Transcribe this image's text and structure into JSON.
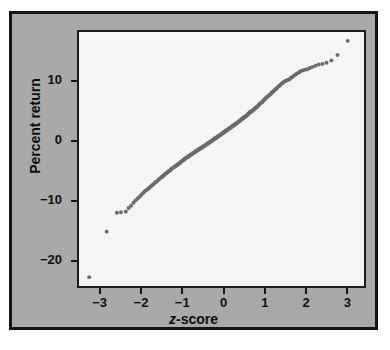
{
  "figure": {
    "panel_bg": "#a9a9a9",
    "plot_bg": "#f5f5f5",
    "frame_color": "#141414",
    "point_color": "#6b6b6b"
  },
  "axes": {
    "x_label_prefix": "z",
    "x_label_suffix": "-score",
    "y_label": "Percent return",
    "x_ticks": [
      "−3",
      "−2",
      "−1",
      "0",
      "1",
      "2",
      "3"
    ],
    "y_ticks": [
      "10",
      "0",
      "−10",
      "−20"
    ]
  },
  "chart_data": {
    "type": "scatter",
    "title": "",
    "subtitle": "",
    "xlabel": "z-score",
    "ylabel": "Percent return",
    "xlim": [
      -3.55,
      3.45
    ],
    "ylim": [
      -24.5,
      18.5
    ],
    "xticks": [
      -3,
      -2,
      -1,
      0,
      1,
      2,
      3
    ],
    "yticks": [
      10,
      0,
      -10,
      -20
    ],
    "grid": false,
    "legend": null,
    "annotations": [],
    "series": [
      {
        "name": "Percent return vs z-score",
        "marker": "circle",
        "color": "#6b6b6b",
        "x": [
          -3.3,
          -2.87,
          -2.62,
          -2.52,
          -2.4,
          -2.33,
          -2.27,
          -2.21,
          -2.16,
          -2.11,
          -2.06,
          -2.02,
          -1.98,
          -1.94,
          -1.9,
          -1.86,
          -1.83,
          -1.79,
          -1.76,
          -1.73,
          -1.7,
          -1.67,
          -1.64,
          -1.61,
          -1.58,
          -1.56,
          -1.53,
          -1.5,
          -1.48,
          -1.45,
          -1.43,
          -1.4,
          -1.38,
          -1.36,
          -1.33,
          -1.31,
          -1.29,
          -1.27,
          -1.25,
          -1.22,
          -1.2,
          -1.18,
          -1.16,
          -1.14,
          -1.12,
          -1.1,
          -1.08,
          -1.06,
          -1.05,
          -1.03,
          -1.01,
          -0.99,
          -0.97,
          -0.95,
          -0.94,
          -0.92,
          -0.9,
          -0.88,
          -0.87,
          -0.85,
          -0.83,
          -0.82,
          -0.8,
          -0.78,
          -0.77,
          -0.75,
          -0.74,
          -0.72,
          -0.7,
          -0.69,
          -0.67,
          -0.66,
          -0.64,
          -0.63,
          -0.61,
          -0.6,
          -0.58,
          -0.57,
          -0.55,
          -0.54,
          -0.52,
          -0.51,
          -0.49,
          -0.48,
          -0.46,
          -0.45,
          -0.43,
          -0.42,
          -0.41,
          -0.39,
          -0.38,
          -0.36,
          -0.35,
          -0.33,
          -0.32,
          -0.31,
          -0.29,
          -0.28,
          -0.26,
          -0.25,
          -0.24,
          -0.22,
          -0.21,
          -0.19,
          -0.18,
          -0.17,
          -0.15,
          -0.14,
          -0.13,
          -0.11,
          -0.1,
          -0.08,
          -0.07,
          -0.06,
          -0.04,
          -0.03,
          -0.02,
          0.0,
          0.01,
          0.02,
          0.04,
          0.05,
          0.06,
          0.08,
          0.09,
          0.11,
          0.12,
          0.13,
          0.15,
          0.16,
          0.17,
          0.19,
          0.2,
          0.22,
          0.23,
          0.24,
          0.26,
          0.27,
          0.28,
          0.3,
          0.31,
          0.33,
          0.34,
          0.35,
          0.37,
          0.38,
          0.4,
          0.41,
          0.42,
          0.44,
          0.45,
          0.47,
          0.48,
          0.5,
          0.51,
          0.53,
          0.54,
          0.56,
          0.57,
          0.59,
          0.6,
          0.62,
          0.63,
          0.65,
          0.66,
          0.68,
          0.7,
          0.71,
          0.73,
          0.75,
          0.76,
          0.78,
          0.8,
          0.81,
          0.83,
          0.85,
          0.87,
          0.88,
          0.9,
          0.92,
          0.94,
          0.96,
          0.98,
          0.99,
          1.01,
          1.03,
          1.05,
          1.07,
          1.09,
          1.12,
          1.14,
          1.16,
          1.18,
          1.2,
          1.23,
          1.25,
          1.27,
          1.3,
          1.32,
          1.35,
          1.38,
          1.4,
          1.43,
          1.46,
          1.49,
          1.52,
          1.55,
          1.58,
          1.62,
          1.65,
          1.69,
          1.73,
          1.77,
          1.81,
          1.86,
          1.9,
          1.95,
          2.0,
          2.06,
          2.12,
          2.19,
          2.26,
          2.34,
          2.43,
          2.53,
          2.65,
          2.8,
          3.05
        ],
        "y": [
          -23.0,
          -15.3,
          -12.1,
          -12.0,
          -11.9,
          -11.3,
          -10.9,
          -10.4,
          -10.0,
          -9.7,
          -9.4,
          -9.1,
          -8.8,
          -8.5,
          -8.3,
          -8.1,
          -7.9,
          -7.7,
          -7.5,
          -7.3,
          -7.1,
          -6.9,
          -6.8,
          -6.6,
          -6.4,
          -6.3,
          -6.1,
          -6.0,
          -5.8,
          -5.7,
          -5.5,
          -5.4,
          -5.3,
          -5.1,
          -5.0,
          -4.9,
          -4.8,
          -4.6,
          -4.5,
          -4.4,
          -4.3,
          -4.2,
          -4.1,
          -4.0,
          -3.9,
          -3.8,
          -3.7,
          -3.6,
          -3.5,
          -3.4,
          -3.3,
          -3.2,
          -3.1,
          -3.0,
          -2.9,
          -2.8,
          -2.7,
          -2.7,
          -2.6,
          -2.5,
          -2.4,
          -2.3,
          -2.3,
          -2.2,
          -2.1,
          -2.0,
          -2.0,
          -1.9,
          -1.8,
          -1.7,
          -1.7,
          -1.6,
          -1.5,
          -1.5,
          -1.4,
          -1.3,
          -1.3,
          -1.2,
          -1.1,
          -1.1,
          -1.0,
          -0.9,
          -0.9,
          -0.8,
          -0.7,
          -0.7,
          -0.6,
          -0.5,
          -0.5,
          -0.4,
          -0.3,
          -0.3,
          -0.2,
          -0.1,
          -0.1,
          0.0,
          0.1,
          0.1,
          0.2,
          0.3,
          0.3,
          0.4,
          0.5,
          0.5,
          0.6,
          0.7,
          0.7,
          0.8,
          0.9,
          0.9,
          1.0,
          1.1,
          1.1,
          1.2,
          1.3,
          1.3,
          1.4,
          1.5,
          1.5,
          1.6,
          1.7,
          1.7,
          1.8,
          1.9,
          1.9,
          2.0,
          2.1,
          2.1,
          2.2,
          2.3,
          2.3,
          2.4,
          2.5,
          2.5,
          2.6,
          2.7,
          2.7,
          2.8,
          2.9,
          2.9,
          3.0,
          3.1,
          3.2,
          3.2,
          3.3,
          3.4,
          3.5,
          3.5,
          3.6,
          3.7,
          3.8,
          3.8,
          3.9,
          4.0,
          4.1,
          4.2,
          4.2,
          4.3,
          4.4,
          4.5,
          4.6,
          4.7,
          4.8,
          4.9,
          5.0,
          5.0,
          5.1,
          5.2,
          5.3,
          5.4,
          5.5,
          5.6,
          5.7,
          5.8,
          5.9,
          6.0,
          6.2,
          6.3,
          6.4,
          6.5,
          6.6,
          6.7,
          6.9,
          7.0,
          7.1,
          7.2,
          7.4,
          7.5,
          7.6,
          7.8,
          7.9,
          8.0,
          8.2,
          8.3,
          8.5,
          8.6,
          8.8,
          8.9,
          9.1,
          9.3,
          9.4,
          9.6,
          9.8,
          9.9,
          10.1,
          10.2,
          10.3,
          10.4,
          10.5,
          10.7,
          10.9,
          11.1,
          11.3,
          11.5,
          11.7,
          11.9,
          12.0,
          12.1,
          12.2,
          12.4,
          12.6,
          12.8,
          13.0,
          13.1,
          13.3,
          13.7,
          14.6,
          17.0
        ]
      }
    ]
  }
}
